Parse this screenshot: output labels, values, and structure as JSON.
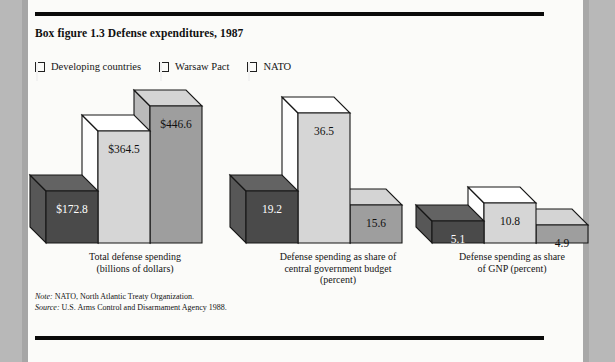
{
  "figure": {
    "title": "Box figure 1.3  Defense expenditures, 1987",
    "note": "Note:  NATO, North Atlantic Treaty Organization.",
    "source": "Source:  U.S. Arms Control and Disarmament Agency 1988."
  },
  "legend": {
    "items": [
      {
        "label": "Developing countries",
        "color": "#4a4a4a"
      },
      {
        "label": "Warsaw Pact",
        "color": "#d6d6d6"
      },
      {
        "label": "NATO",
        "color": "#9e9e9e"
      }
    ]
  },
  "chart_data": {
    "type": "bar",
    "title": "Box figure 1.3  Defense expenditures, 1987",
    "xlabel": "",
    "ylabel": "",
    "grid": false,
    "legend_position": "top-left",
    "style": "3d-grouped-bar",
    "categories": [
      "Total defense spending\n(billions of dollars)",
      "Defense spending as share of\ncentral government budget\n(percent)",
      "Defense spending as share\nof GNP (percent)"
    ],
    "series": [
      {
        "name": "Developing countries",
        "color": "#4a4a4a",
        "values": [
          172.8,
          19.2,
          5.1
        ],
        "labels": [
          "$172.8",
          "19.2",
          "5.1"
        ]
      },
      {
        "name": "Warsaw Pact",
        "color": "#d6d6d6",
        "values": [
          364.5,
          36.5,
          10.8
        ],
        "labels": [
          "$364.5",
          "36.5",
          "10.8"
        ]
      },
      {
        "name": "NATO",
        "color": "#9e9e9e",
        "values": [
          446.6,
          15.6,
          4.9
        ],
        "labels": [
          "$446.6",
          "15.6",
          "4.9"
        ]
      }
    ],
    "groups": [
      {
        "label_lines": [
          "Total defense spending",
          "(billions of dollars)"
        ],
        "units": "billions of dollars",
        "bars": [
          {
            "series": "Developing countries",
            "value": 172.8,
            "label": "$172.8"
          },
          {
            "series": "Warsaw Pact",
            "value": 364.5,
            "label": "$364.5"
          },
          {
            "series": "NATO",
            "value": 446.6,
            "label": "$446.6"
          }
        ]
      },
      {
        "label_lines": [
          "Defense spending as share of",
          "central government budget",
          "(percent)"
        ],
        "units": "percent",
        "bars": [
          {
            "series": "Developing countries",
            "value": 19.2,
            "label": "19.2"
          },
          {
            "series": "Warsaw Pact",
            "value": 36.5,
            "label": "36.5"
          },
          {
            "series": "NATO",
            "value": 15.6,
            "label": "15.6"
          }
        ]
      },
      {
        "label_lines": [
          "Defense spending as share",
          "of GNP (percent)"
        ],
        "units": "percent",
        "bars": [
          {
            "series": "Developing countries",
            "value": 5.1,
            "label": "5.1"
          },
          {
            "series": "Warsaw Pact",
            "value": 10.8,
            "label": "10.8"
          },
          {
            "series": "NATO",
            "value": 4.9,
            "label": "4.9"
          }
        ]
      }
    ]
  },
  "geometry": {
    "baseline_y": 243,
    "depth_x": 16,
    "depth_y": 16,
    "bar_width": 52,
    "groups": [
      {
        "x": 46,
        "heights": [
          52,
          112,
          137
        ]
      },
      {
        "x": 246,
        "heights": [
          52,
          130,
          38
        ]
      },
      {
        "x": 432,
        "heights": [
          22,
          40,
          18
        ]
      }
    ],
    "label_positions": [
      {
        "left": 40,
        "top": 251,
        "width": 190
      },
      {
        "left": 238,
        "top": 251,
        "width": 200
      },
      {
        "left": 422,
        "top": 251,
        "width": 180
      }
    ]
  }
}
